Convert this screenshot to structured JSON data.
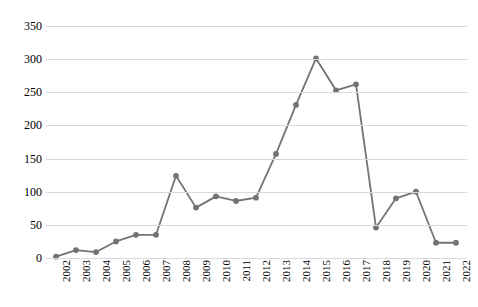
{
  "chart_data": {
    "type": "line",
    "title": "",
    "subtitle": "",
    "xlabel": "",
    "ylabel": "",
    "categories": [
      "2002",
      "2003",
      "2004",
      "2005",
      "2006",
      "2007",
      "2008",
      "2009",
      "2010",
      "2011",
      "2012",
      "2013",
      "2014",
      "2015",
      "2016",
      "2017",
      "2018",
      "2019",
      "2020",
      "2021",
      "2022"
    ],
    "values": [
      2,
      12,
      9,
      25,
      35,
      35,
      124,
      76,
      93,
      86,
      91,
      157,
      231,
      301,
      253,
      262,
      46,
      90,
      100,
      23,
      23
    ],
    "series": [
      {
        "name": "",
        "values": [
          2,
          12,
          9,
          25,
          35,
          35,
          124,
          76,
          93,
          86,
          91,
          157,
          231,
          301,
          253,
          262,
          46,
          90,
          100,
          23,
          23
        ]
      }
    ],
    "ylim": [
      0,
      350
    ],
    "yticks": [
      0,
      50,
      100,
      150,
      200,
      250,
      300,
      350
    ],
    "ytick_labels": [
      "0",
      "50",
      "100",
      "150",
      "200",
      "250",
      "300",
      "350"
    ],
    "grid": true,
    "legend": "none",
    "marker": "circle",
    "colors": {
      "line": "#737373",
      "marker": "#737373",
      "gridline": "#d9d9d9",
      "text": "#000000",
      "background": "#ffffff"
    }
  }
}
